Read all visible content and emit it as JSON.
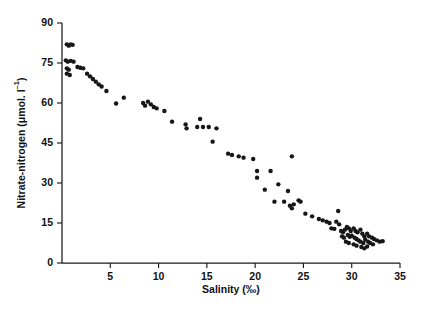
{
  "figure": {
    "background": "#ffffff",
    "ink_color": "#161616"
  },
  "chart_data": {
    "type": "scatter",
    "title": "",
    "xlabel": "Salinity (‰)",
    "ylabel": "Nitrate-nitrogen (μmol. l⁻¹)",
    "ylabel_parts": {
      "main": "Nitrate-nitrogen (",
      "mu": "μ",
      "units": "mol. l",
      "exponent": "–1"
    },
    "xlim": [
      0,
      35
    ],
    "ylim": [
      0,
      90
    ],
    "xticks": [
      5,
      10,
      15,
      20,
      25,
      30,
      35
    ],
    "xtick_labels": [
      "5",
      "10",
      "15",
      "20",
      "25",
      "30",
      "35"
    ],
    "yticks": [
      0,
      15,
      30,
      45,
      60,
      75,
      90
    ],
    "ytick_labels": [
      "0",
      "15",
      "30",
      "45",
      "60",
      "75",
      "90"
    ],
    "grid": false,
    "legend": null,
    "marker": {
      "shape": "circle",
      "size_px": 4.4,
      "color": "#161616"
    },
    "axes_drawn": [
      "left",
      "bottom"
    ],
    "series": [
      {
        "name": "Nitrate-nitrogen vs Salinity",
        "points": [
          [
            0.5,
            82.0
          ],
          [
            0.7,
            81.5
          ],
          [
            0.9,
            82.0
          ],
          [
            1.1,
            81.8
          ],
          [
            0.4,
            76.0
          ],
          [
            0.6,
            75.5
          ],
          [
            0.9,
            75.8
          ],
          [
            1.2,
            75.5
          ],
          [
            0.5,
            73.0
          ],
          [
            0.7,
            72.5
          ],
          [
            0.5,
            71.0
          ],
          [
            0.8,
            70.5
          ],
          [
            1.6,
            73.5
          ],
          [
            1.9,
            73.2
          ],
          [
            2.2,
            73.0
          ],
          [
            2.6,
            71.0
          ],
          [
            2.9,
            70.0
          ],
          [
            3.2,
            69.0
          ],
          [
            3.5,
            68.0
          ],
          [
            3.8,
            67.0
          ],
          [
            4.1,
            66.2
          ],
          [
            4.6,
            64.5
          ],
          [
            5.6,
            59.8
          ],
          [
            6.4,
            62.0
          ],
          [
            8.4,
            60.0
          ],
          [
            8.6,
            59.0
          ],
          [
            8.9,
            60.5
          ],
          [
            9.2,
            59.5
          ],
          [
            9.5,
            58.5
          ],
          [
            9.8,
            58.0
          ],
          [
            10.6,
            57.0
          ],
          [
            11.4,
            53.0
          ],
          [
            12.8,
            52.0
          ],
          [
            12.9,
            50.5
          ],
          [
            14.0,
            51.0
          ],
          [
            14.6,
            51.0
          ],
          [
            15.2,
            51.0
          ],
          [
            14.3,
            54.0
          ],
          [
            16.0,
            50.5
          ],
          [
            15.6,
            45.5
          ],
          [
            17.2,
            41.0
          ],
          [
            17.6,
            40.5
          ],
          [
            18.3,
            40.0
          ],
          [
            18.8,
            39.5
          ],
          [
            19.8,
            39.0
          ],
          [
            20.2,
            34.5
          ],
          [
            20.2,
            32.0
          ],
          [
            21.6,
            34.5
          ],
          [
            21.0,
            27.5
          ],
          [
            22.4,
            29.5
          ],
          [
            22.0,
            23.0
          ],
          [
            23.0,
            23.0
          ],
          [
            23.4,
            27.0
          ],
          [
            23.8,
            40.0
          ],
          [
            23.6,
            21.5
          ],
          [
            23.8,
            20.5
          ],
          [
            24.0,
            22.0
          ],
          [
            24.5,
            23.5
          ],
          [
            24.7,
            23.0
          ],
          [
            25.2,
            18.5
          ],
          [
            25.9,
            17.5
          ],
          [
            26.6,
            16.5
          ],
          [
            27.0,
            16.0
          ],
          [
            27.4,
            15.5
          ],
          [
            27.7,
            15.0
          ],
          [
            27.9,
            13.0
          ],
          [
            28.2,
            12.8
          ],
          [
            28.6,
            19.5
          ],
          [
            28.4,
            15.5
          ],
          [
            28.7,
            14.5
          ],
          [
            28.9,
            12.0
          ],
          [
            29.1,
            11.5
          ],
          [
            29.3,
            12.5
          ],
          [
            29.0,
            10.0
          ],
          [
            29.2,
            9.5
          ],
          [
            29.5,
            13.5
          ],
          [
            29.7,
            13.0
          ],
          [
            29.9,
            12.0
          ],
          [
            29.6,
            10.5
          ],
          [
            29.8,
            9.8
          ],
          [
            30.0,
            10.2
          ],
          [
            29.4,
            8.0
          ],
          [
            29.7,
            7.5
          ],
          [
            30.2,
            13.0
          ],
          [
            30.4,
            12.0
          ],
          [
            30.6,
            11.5
          ],
          [
            30.3,
            9.5
          ],
          [
            30.5,
            9.0
          ],
          [
            30.7,
            8.5
          ],
          [
            30.2,
            7.0
          ],
          [
            30.5,
            6.5
          ],
          [
            30.9,
            12.5
          ],
          [
            31.1,
            11.0
          ],
          [
            31.3,
            10.0
          ],
          [
            30.9,
            8.0
          ],
          [
            31.2,
            7.5
          ],
          [
            31.4,
            8.8
          ],
          [
            31.0,
            6.0
          ],
          [
            31.3,
            5.5
          ],
          [
            31.6,
            11.0
          ],
          [
            31.8,
            10.0
          ],
          [
            31.7,
            8.0
          ],
          [
            31.9,
            7.5
          ],
          [
            31.6,
            6.2
          ],
          [
            32.1,
            9.5
          ],
          [
            32.3,
            9.0
          ],
          [
            32.2,
            7.0
          ],
          [
            32.6,
            8.5
          ],
          [
            32.9,
            8.0
          ],
          [
            33.2,
            8.2
          ]
        ]
      }
    ]
  }
}
